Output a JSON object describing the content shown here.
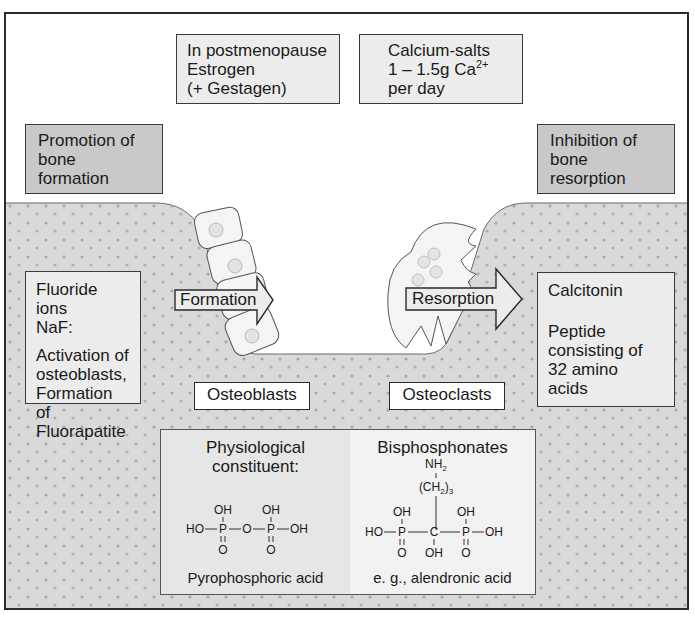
{
  "diagram": {
    "colors": {
      "frame": "#2a2a2a",
      "bone_fill": "#d9d9d9",
      "bone_dots": "#a8a8a8",
      "highlight_box": "#c9c9c9",
      "light_box": "#ececec",
      "cell_fill": "#f4f4f4"
    },
    "top_boxes": {
      "estrogen": {
        "lines": [
          "In postmenopause",
          "Estrogen",
          "(+ Gestagen)"
        ]
      },
      "calcium": {
        "line1": "Calcium-salts",
        "line2_prefix": "1 – 1.5g Ca",
        "line2_sup": "2+",
        "line3": "per day"
      }
    },
    "category_boxes": {
      "promotion": {
        "lines": [
          "Promotion of",
          "bone",
          "formation"
        ]
      },
      "inhibition": {
        "lines": [
          "Inhibition of",
          "bone",
          "resorption"
        ]
      }
    },
    "fluoride_box": {
      "lines": [
        "Fluoride ions",
        "NaF:"
      ],
      "description": [
        "Activation of",
        "osteoblasts,",
        "Formation of",
        "Fluorapatite"
      ]
    },
    "calcitonin_box": {
      "title": "Calcitonin",
      "description": [
        "Peptide",
        "consisting of",
        "32 amino",
        "acids"
      ]
    },
    "arrows": {
      "formation": "Formation",
      "resorption": "Resorption"
    },
    "cell_labels": {
      "osteoblasts": "Osteoblasts",
      "osteoclasts": "Osteoclasts"
    },
    "chemistry": {
      "physiological": {
        "title_lines": [
          "Physiological",
          "constituent:"
        ],
        "structure": {
          "top": [
            "OH",
            "OH"
          ],
          "chain": [
            "HO",
            "P",
            "O",
            "P",
            "OH"
          ],
          "bottom": [
            "O",
            "O"
          ]
        },
        "caption": "Pyrophosphoric acid"
      },
      "bisphosphonates": {
        "title": "Bisphosphonates",
        "structure": {
          "amine": "NH",
          "amine_sub": "2",
          "chain_group": "(CH",
          "chain_group_sub": "2",
          "chain_group_close": ")",
          "chain_group_count": "3",
          "top": [
            "OH",
            "OH"
          ],
          "chain": [
            "HO",
            "P",
            "C",
            "P",
            "OH"
          ],
          "bottom": [
            "O",
            "OH",
            "O"
          ]
        },
        "caption": "e. g., alendronic acid"
      }
    }
  }
}
